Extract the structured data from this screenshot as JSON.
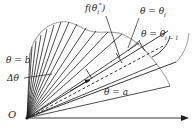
{
  "figure": {
    "type": "polar-sector-area-diagram",
    "background_color": "#ffffff",
    "line_color": "#1a1a1a",
    "curve_color": "#9a9a9a",
    "dashed_color": "#1a1a1a"
  },
  "labels": {
    "function_value": "f(θ",
    "function_value_sub": "i",
    "function_value_sup": "*",
    "function_value_close": ")",
    "theta_i": "θ = θ",
    "theta_i_sub": "i",
    "theta_i_minus_1": "θ = θ",
    "theta_i_minus_1_sub": "i − 1",
    "theta_b": "θ = b",
    "delta_theta": "Δθ",
    "theta_a": "θ = a",
    "origin": "O"
  },
  "geometry": {
    "origin_x": 27,
    "origin_y": 118,
    "axis_end_x": 188,
    "axis_end_y": 118,
    "ray_angles_deg": [
      14,
      27,
      35,
      46,
      54,
      60,
      65,
      70,
      74,
      78,
      82,
      86
    ],
    "sector_ray_a_deg": 14,
    "sector_ray_b_deg": 86,
    "dashed_ray_deg": 31,
    "curve_label": "r = f(θ)"
  }
}
